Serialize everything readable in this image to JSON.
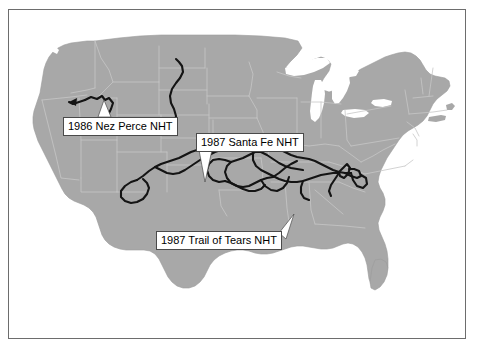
{
  "figure": {
    "frame_color": "#6d6d6d",
    "background_color": "#ffffff"
  },
  "map": {
    "land_color": "#a8a8a8",
    "state_border_color": "#c6c6c6",
    "water_color": "#ffffff",
    "coastline_color": "#9a9a9a",
    "region": "Contiguous United States"
  },
  "callouts": [
    {
      "id": "nez-perce",
      "label": "1986 Nez Perce NHT",
      "year": "1986",
      "trail_name": "Nez Perce NHT",
      "box_color": "#ffffff",
      "border_color": "#4a4a4a",
      "text_color": "#000000"
    },
    {
      "id": "santa-fe",
      "label": "1987 Santa Fe NHT",
      "year": "1987",
      "trail_name": "Santa Fe NHT",
      "box_color": "#ffffff",
      "border_color": "#4a4a4a",
      "text_color": "#000000"
    },
    {
      "id": "trail-of-tears",
      "label": "1987 Trail of Tears NHT",
      "year": "1987",
      "trail_name": "Trail of Tears NHT",
      "box_color": "#ffffff",
      "border_color": "#4a4a4a",
      "text_color": "#000000"
    }
  ],
  "trails": {
    "line_color": "#141414",
    "names": [
      "Nez Perce NHT",
      "Santa Fe NHT",
      "Trail of Tears NHT"
    ]
  }
}
